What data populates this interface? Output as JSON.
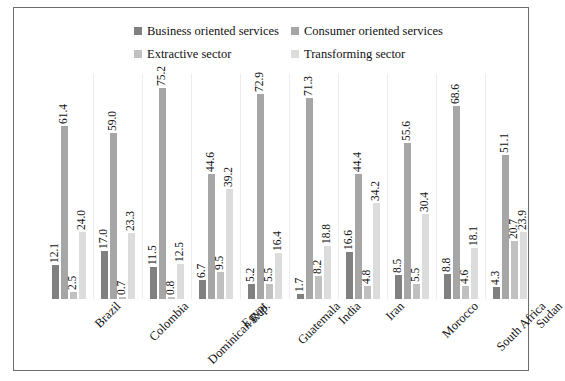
{
  "chart_data": {
    "type": "bar",
    "title": "",
    "subtitle": "",
    "xlabel": "",
    "ylabel": "",
    "ylim": [
      0,
      80
    ],
    "grid": false,
    "legend_position": "top",
    "categories": [
      "Brazil",
      "Colombia",
      "Dominican Rep.",
      "Egypt",
      "Guatemala",
      "India",
      "Iran",
      "Morocco",
      "South Africa",
      "Sudan"
    ],
    "series": [
      {
        "name": "Business oriented services",
        "color": "#808080",
        "values": [
          12.1,
          17.0,
          11.5,
          6.7,
          5.2,
          1.7,
          16.6,
          8.5,
          8.8,
          4.3
        ]
      },
      {
        "name": "Consumer oriented services",
        "color": "#a6a6a6",
        "values": [
          61.4,
          59.0,
          75.2,
          44.6,
          72.9,
          71.3,
          44.4,
          55.6,
          68.6,
          51.1
        ]
      },
      {
        "name": "Extractive sector",
        "color": "#c0c0c0",
        "values": [
          2.5,
          0.7,
          0.8,
          9.5,
          5.5,
          8.2,
          4.8,
          5.5,
          4.6,
          20.7
        ]
      },
      {
        "name": "Transforming sector",
        "color": "#dcdcdc",
        "values": [
          24.0,
          23.3,
          12.5,
          39.2,
          16.4,
          18.8,
          34.2,
          30.4,
          18.1,
          23.9
        ]
      }
    ],
    "value_labels": {
      "Brazil": [
        "12.1",
        "61.4",
        "2.5",
        "24.0"
      ],
      "Colombia": [
        "17.0",
        "59.0",
        "0.7",
        "23.3"
      ],
      "Dominican Rep.": [
        "11.5",
        "75.2",
        "0.8",
        "12.5"
      ],
      "Egypt": [
        "6.7",
        "44.6",
        "9.5",
        "39.2"
      ],
      "Guatemala": [
        "5.2",
        "72.9",
        "5.5",
        "16.4"
      ],
      "India": [
        "1.7",
        "71.3",
        "8.2",
        "18.8"
      ],
      "Iran": [
        "16.6",
        "44.4",
        "4.8",
        "34.2"
      ],
      "Morocco": [
        "8.5",
        "55.6",
        "5.5",
        "30.4"
      ],
      "South Africa": [
        "8.8",
        "68.6",
        "4.6",
        "18.1"
      ],
      "Sudan": [
        "4.3",
        "51.1",
        "20.7",
        "23.9"
      ]
    }
  },
  "legend": {
    "items": [
      {
        "label": "Business oriented services",
        "color": "#808080"
      },
      {
        "label": "Consumer oriented services",
        "color": "#a6a6a6"
      },
      {
        "label": "Extractive sector",
        "color": "#c0c0c0"
      },
      {
        "label": "Transforming sector",
        "color": "#dcdcdc"
      }
    ]
  }
}
